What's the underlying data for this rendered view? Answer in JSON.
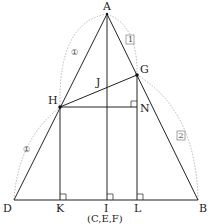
{
  "diagram": {
    "type": "geometry",
    "points": {
      "A": {
        "label": "A",
        "x": 107,
        "y": 14
      },
      "D": {
        "label": "D",
        "x": 14,
        "y": 200
      },
      "B": {
        "label": "B",
        "x": 198,
        "y": 200
      },
      "G": {
        "label": "G",
        "x": 137,
        "y": 75
      },
      "H": {
        "label": "H",
        "x": 60,
        "y": 107
      },
      "J": {
        "label": "J",
        "x": 107,
        "y": 87
      },
      "N": {
        "label": "N",
        "x": 137,
        "y": 107
      },
      "K": {
        "label": "K",
        "x": 60,
        "y": 200
      },
      "I": {
        "label": "I",
        "x": 107,
        "y": 200
      },
      "L": {
        "label": "L",
        "x": 137,
        "y": 200
      }
    },
    "coincident_label": "(C,E,F)",
    "ratio_marks": {
      "AH": "①",
      "HD": "①",
      "AG": "1",
      "GB": "2"
    },
    "right_angles": [
      "K",
      "I",
      "L",
      "N"
    ],
    "segments": [
      "AD",
      "AB",
      "DB",
      "AI",
      "HG",
      "HN",
      "HK",
      "GL"
    ]
  }
}
